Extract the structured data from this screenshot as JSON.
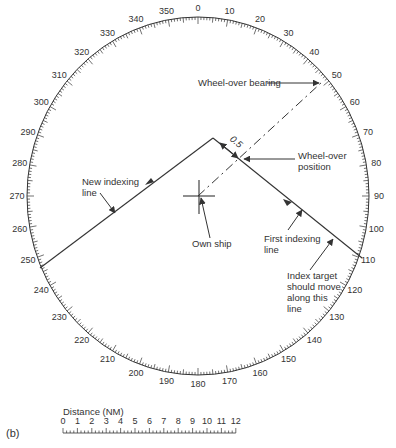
{
  "panel_label": "(b)",
  "compass": {
    "center": [
      198,
      196
    ],
    "radius_x": 171,
    "radius_y": 179,
    "bearing_labels": [
      "0",
      "10",
      "20",
      "30",
      "40",
      "50",
      "60",
      "70",
      "80",
      "90",
      "100",
      "110",
      "120",
      "130",
      "140",
      "150",
      "160",
      "170",
      "180",
      "190",
      "200",
      "210",
      "220",
      "230",
      "240",
      "250",
      "260",
      "270",
      "280",
      "290",
      "300",
      "310",
      "320",
      "330",
      "340",
      "350"
    ]
  },
  "annotations": {
    "wheel_over_bearing": "Wheel-over bearing",
    "wheel_over_position_1": "Wheel-over",
    "wheel_over_position_2": "position",
    "distance_05": "0.5",
    "new_indexing_1": "New indexing",
    "new_indexing_2": "line",
    "own_ship": "Own ship",
    "first_indexing_1": "First indexing",
    "first_indexing_2": "line",
    "index_target_1": "Index target",
    "index_target_2": "should move",
    "index_target_3": "along this",
    "index_target_4": "line"
  },
  "distance_scale": {
    "title": "Distance (NM)",
    "ticks": [
      "0",
      "1",
      "2",
      "3",
      "4",
      "5",
      "6",
      "7",
      "8",
      "9",
      "10",
      "11",
      "12"
    ]
  },
  "colors": {
    "ink": "#333333",
    "background": "#ffffff"
  }
}
